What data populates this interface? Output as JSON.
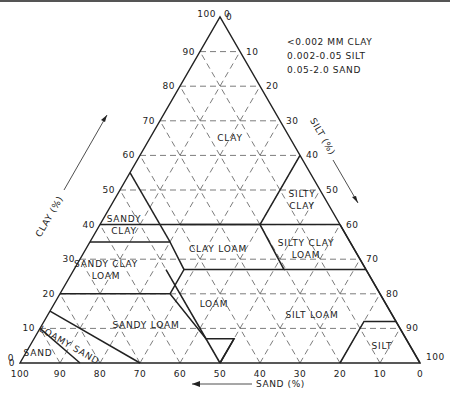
{
  "legend": [
    "<0.002 MM CLAY",
    "0.002-0.05 SILT",
    "0.05-2.0 SAND"
  ],
  "axes": {
    "clay": {
      "label": "CLAY (%)",
      "ticks": [
        0,
        10,
        20,
        30,
        40,
        50,
        60,
        70,
        80,
        90,
        100
      ]
    },
    "silt": {
      "label": "SILT (%)",
      "ticks": [
        0,
        10,
        20,
        30,
        40,
        50,
        60,
        70,
        80,
        90,
        100
      ]
    },
    "sand": {
      "label": "SAND (%)",
      "ticks": [
        100,
        90,
        80,
        70,
        60,
        50,
        40,
        30,
        20,
        10,
        0
      ]
    }
  },
  "classes": [
    {
      "name": "CLAY",
      "lines": [
        "CLAY"
      ],
      "label_at": [
        65,
        20
      ]
    },
    {
      "name": "SILTY CLAY",
      "lines": [
        "SILTY",
        "CLAY"
      ],
      "label_at": [
        47,
        47
      ]
    },
    {
      "name": "SANDY CLAY",
      "lines": [
        "SANDY",
        "CLAY"
      ],
      "label_at": [
        40,
        6
      ]
    },
    {
      "name": "CLAY LOAM",
      "lines": [
        "CLAY LOAM"
      ],
      "label_at": [
        33,
        33
      ]
    },
    {
      "name": "SILTY CLAY LOAM",
      "lines": [
        "SILTY CLAY",
        "LOAM"
      ],
      "label_at": [
        33,
        55
      ]
    },
    {
      "name": "SANDY CLAY LOAM",
      "lines": [
        "SANDY CLAY",
        "LOAM"
      ],
      "label_at": [
        27,
        8
      ]
    },
    {
      "name": "LOAM",
      "lines": [
        "LOAM"
      ],
      "label_at": [
        17,
        40
      ]
    },
    {
      "name": "SILT LOAM",
      "lines": [
        "SILT LOAM"
      ],
      "label_at": [
        14,
        66
      ]
    },
    {
      "name": "SANDY LOAM",
      "lines": [
        "SANDY LOAM"
      ],
      "label_at": [
        11,
        26
      ]
    },
    {
      "name": "LOAMY SAND",
      "lines": [
        "LOAMY",
        "SAND"
      ],
      "label_at": [
        5,
        10
      ]
    },
    {
      "name": "SAND",
      "lines": [
        "SAND"
      ],
      "label_at": [
        3,
        3
      ]
    },
    {
      "name": "SILT",
      "lines": [
        "SILT"
      ],
      "label_at": [
        5,
        88
      ]
    }
  ],
  "boundaries": [
    [
      [
        0,
        15
      ],
      [
        10,
        0
      ]
    ],
    [
      [
        0,
        30
      ],
      [
        15,
        0
      ]
    ],
    [
      [
        20,
        0
      ],
      [
        20,
        27.5
      ],
      [
        7,
        43
      ],
      [
        7,
        50
      ],
      [
        0,
        50
      ]
    ],
    [
      [
        35,
        0
      ],
      [
        35,
        20
      ],
      [
        27,
        27.5
      ],
      [
        20,
        27.5
      ]
    ],
    [
      [
        55,
        0
      ],
      [
        35,
        20
      ]
    ],
    [
      [
        27,
        27.5
      ],
      [
        27,
        52.5
      ],
      [
        40,
        40
      ],
      [
        40,
        20
      ]
    ],
    [
      [
        40,
        0
      ],
      [
        40,
        60
      ]
    ],
    [
      [
        60,
        40
      ],
      [
        40,
        40
      ]
    ],
    [
      [
        27,
        52.5
      ],
      [
        27,
        73
      ]
    ],
    [
      [
        40,
        60
      ],
      [
        27,
        73
      ]
    ],
    [
      [
        27,
        73
      ],
      [
        0,
        100
      ]
    ],
    [
      [
        7,
        50
      ],
      [
        0,
        50
      ]
    ],
    [
      [
        12,
        88
      ],
      [
        12,
        80
      ],
      [
        0,
        80
      ]
    ],
    [
      [
        0,
        50
      ],
      [
        27,
        23
      ]
    ]
  ]
}
